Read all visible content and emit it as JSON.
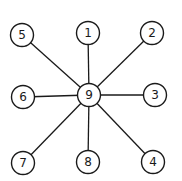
{
  "diagram": {
    "type": "star-graph",
    "center": {
      "id": "9",
      "label": "9",
      "x": 89,
      "y": 95
    },
    "node_radius": 11.5,
    "nodes": [
      {
        "id": "1",
        "label": "1",
        "x": 88,
        "y": 33
      },
      {
        "id": "2",
        "label": "2",
        "x": 152,
        "y": 33
      },
      {
        "id": "3",
        "label": "3",
        "x": 155,
        "y": 95
      },
      {
        "id": "4",
        "label": "4",
        "x": 153,
        "y": 162
      },
      {
        "id": "5",
        "label": "5",
        "x": 22,
        "y": 35
      },
      {
        "id": "6",
        "label": "6",
        "x": 23,
        "y": 97
      },
      {
        "id": "7",
        "label": "7",
        "x": 23,
        "y": 163
      },
      {
        "id": "8",
        "label": "8",
        "x": 88,
        "y": 162
      }
    ],
    "edges": [
      [
        "9",
        "1"
      ],
      [
        "9",
        "2"
      ],
      [
        "9",
        "3"
      ],
      [
        "9",
        "4"
      ],
      [
        "9",
        "5"
      ],
      [
        "9",
        "6"
      ],
      [
        "9",
        "7"
      ],
      [
        "9",
        "8"
      ]
    ],
    "colors": {
      "stroke": "#1a1a1a",
      "background": "#ffffff"
    }
  }
}
